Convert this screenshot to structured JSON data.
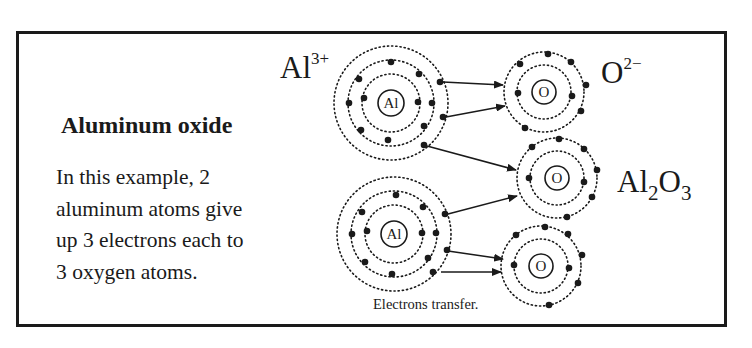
{
  "figure": {
    "title": "Aluminum oxide",
    "description_lines": [
      "In this example, 2",
      "aluminum atoms give",
      "up 3 electrons each to",
      "3 oxygen atoms."
    ],
    "caption": "Electrons transfer.",
    "labels": {
      "al_ion": {
        "symbol": "Al",
        "charge": "3+"
      },
      "o_ion": {
        "symbol": "O",
        "charge": "2−"
      },
      "compound": {
        "p1": "Al",
        "s1": "2",
        "p2": "O",
        "s2": "3"
      }
    },
    "atoms": [
      {
        "id": "al-1",
        "nucleus": "Al",
        "shells": 3,
        "electrons": [
          2,
          8,
          3
        ]
      },
      {
        "id": "al-2",
        "nucleus": "Al",
        "shells": 3,
        "electrons": [
          2,
          8,
          3
        ]
      },
      {
        "id": "o-1",
        "nucleus": "O",
        "shells": 2,
        "electrons": [
          2,
          6
        ]
      },
      {
        "id": "o-2",
        "nucleus": "O",
        "shells": 2,
        "electrons": [
          2,
          6
        ]
      },
      {
        "id": "o-3",
        "nucleus": "O",
        "shells": 2,
        "electrons": [
          2,
          6
        ]
      }
    ],
    "colors": {
      "ink": "#1a1a1a",
      "background": "#ffffff"
    }
  }
}
